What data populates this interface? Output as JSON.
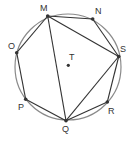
{
  "diagram": {
    "type": "inscribed-polygon",
    "colors": {
      "background": "#ffffff",
      "circle": "#8a8a8a",
      "edges": "#333333",
      "points": "#333333"
    },
    "circle": {
      "cx": 68,
      "cy": 67,
      "r": 53
    },
    "center": {
      "label": "T",
      "x": 68.3,
      "y": 65.3,
      "label_x": 69,
      "label_y": 60
    },
    "points": [
      {
        "label": "M",
        "x": 47.7,
        "y": 16,
        "label_x": 40,
        "label_y": 11
      },
      {
        "label": "N",
        "x": 92.7,
        "y": 19,
        "label_x": 95,
        "label_y": 14
      },
      {
        "label": "S",
        "x": 118.7,
        "y": 56.5,
        "label_x": 120,
        "label_y": 52
      },
      {
        "label": "R",
        "x": 107.3,
        "y": 102,
        "label_x": 108,
        "label_y": 114
      },
      {
        "label": "Q",
        "x": 66,
        "y": 120.7,
        "label_x": 62,
        "label_y": 132
      },
      {
        "label": "P",
        "x": 25.7,
        "y": 99.3,
        "label_x": 18,
        "label_y": 110
      },
      {
        "label": "O",
        "x": 16.7,
        "y": 52.7,
        "label_x": 8,
        "label_y": 49
      }
    ],
    "edges": [
      [
        "M",
        "N"
      ],
      [
        "N",
        "S"
      ],
      [
        "S",
        "R"
      ],
      [
        "R",
        "Q"
      ],
      [
        "Q",
        "P"
      ],
      [
        "P",
        "O"
      ],
      [
        "O",
        "M"
      ],
      [
        "M",
        "S"
      ],
      [
        "M",
        "Q"
      ],
      [
        "S",
        "Q"
      ]
    ]
  }
}
